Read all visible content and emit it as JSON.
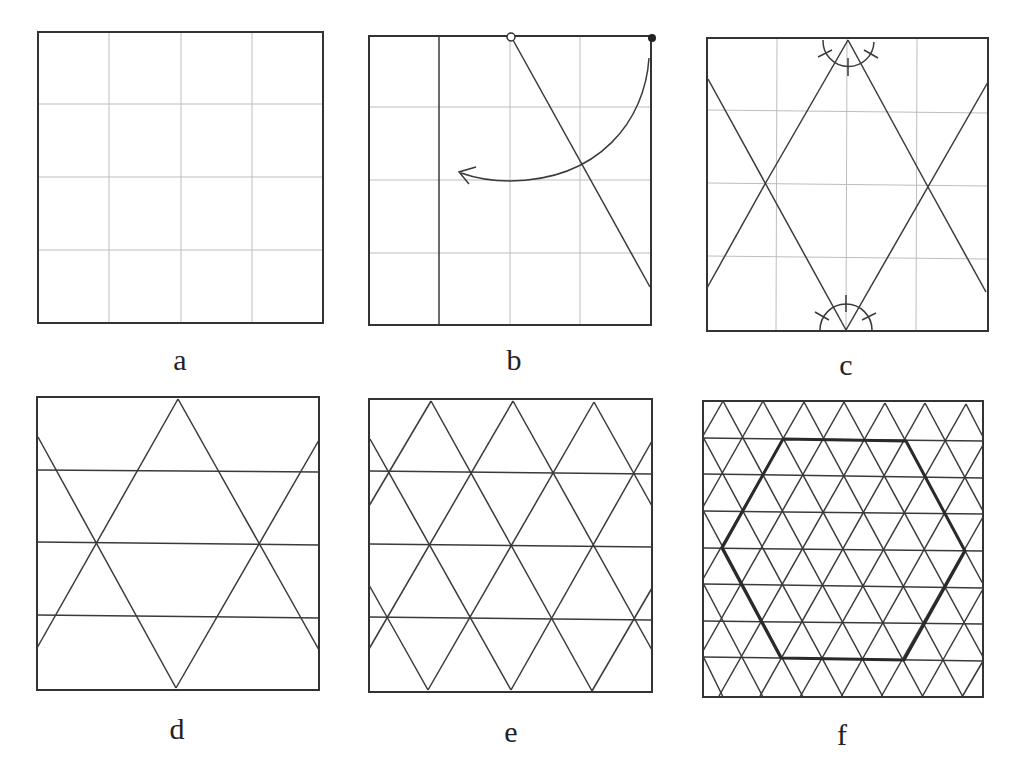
{
  "figure": {
    "panels": [
      {
        "id": "a",
        "label": "a",
        "content": "Square divided into a 4x4 grid of light creases"
      },
      {
        "id": "b",
        "label": "b",
        "content": "Left quarter folded; corner point (filled dot) rotated to meet the open-circle point on top edge, producing diagonal crease; curved arrow shows fold direction"
      },
      {
        "id": "c",
        "label": "c",
        "content": "60-degree creases radiating from the midpoints of the top and bottom edges, with angle-trisection arc marks"
      },
      {
        "id": "d",
        "label": "d",
        "content": "Large triangles formed by 60-degree creases plus three horizontal creases"
      },
      {
        "id": "e",
        "label": "e",
        "content": "Denser triangular grid with four rows of triangles"
      },
      {
        "id": "f",
        "label": "f",
        "content": "Fine triangular grid with bold hexagon outline"
      }
    ]
  },
  "labels": {
    "a": "a",
    "b": "b",
    "c": "c",
    "d": "d",
    "e": "e",
    "f": "f"
  },
  "colors": {
    "line": "#333333",
    "grid": "#bdbdbd",
    "background": "#ffffff"
  }
}
